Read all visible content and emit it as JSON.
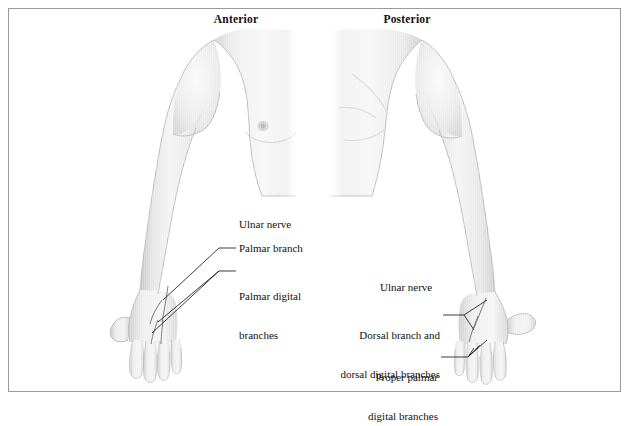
{
  "figure": {
    "title_anterior": "Anterior",
    "title_posterior": "Posterior",
    "background_color": "#ffffff",
    "border_color": "#9a9a9a",
    "text_color": "#111111",
    "body_fill": "#f1f1f1",
    "body_shade": "#c8c8c8",
    "leader_color": "#1b1b1b"
  },
  "anterior": {
    "view_label": "Anterior",
    "annotations": [
      {
        "id": "ulnar-nerve",
        "label": "Ulnar nerve",
        "lines": [
          "Ulnar nerve"
        ],
        "has_leader": false
      },
      {
        "id": "palmar-branch",
        "label": "Palmar branch",
        "lines": [
          "Palmar branch"
        ],
        "has_leader": true
      },
      {
        "id": "palmar-digital-branches",
        "label": "Palmar digital branches",
        "lines": [
          "Palmar digital",
          "branches"
        ],
        "has_leader": true
      }
    ]
  },
  "posterior": {
    "view_label": "Posterior",
    "annotations": [
      {
        "id": "ulnar-nerve",
        "label": "Ulnar nerve",
        "lines": [
          "Ulnar nerve"
        ],
        "has_leader": false
      },
      {
        "id": "dorsal-branch",
        "label": "Dorsal branch and dorsal digital branches",
        "lines": [
          "Dorsal branch and",
          "dorsal digital branches"
        ],
        "has_leader": true
      },
      {
        "id": "proper-palmar-digital-branches",
        "label": "Proper palmar digital branches",
        "lines": [
          "Proper palmar",
          "digital branches"
        ],
        "has_leader": true
      }
    ]
  }
}
